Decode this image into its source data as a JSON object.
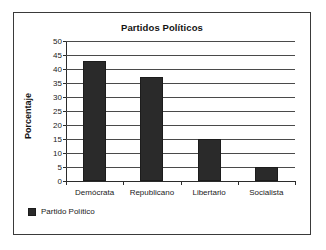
{
  "frame": {
    "border_color": "#3a3a3a",
    "background": "#ffffff"
  },
  "chart_data": {
    "type": "bar",
    "title": "Partidos Políticos",
    "xlabel": "",
    "ylabel": "Porcentaje",
    "categories": [
      "Demócrata",
      "Republicano",
      "Libertario",
      "Socialista"
    ],
    "values": [
      43,
      37,
      15,
      5
    ],
    "series": [
      {
        "name": "Partido Político",
        "values": [
          43,
          37,
          15,
          5
        ],
        "color": "#2a2a2a"
      }
    ],
    "ylim": [
      0,
      50
    ],
    "ytick_step": 5,
    "ytick_labels": [
      "0",
      "5",
      "10",
      "15",
      "20",
      "25",
      "30",
      "35",
      "40",
      "45",
      "50"
    ],
    "grid": true,
    "grid_axis": "y",
    "legend_position": "bottom-left",
    "legend_entries": [
      "Partido Político"
    ],
    "bar_color": "#2a2a2a",
    "units": "percent"
  },
  "legend": {
    "swatch_color": "#2a2a2a",
    "label": "Partido Político"
  }
}
